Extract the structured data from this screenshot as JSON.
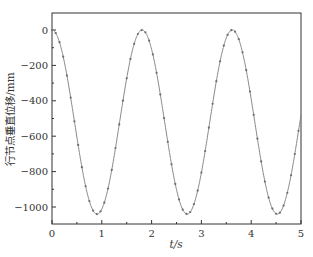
{
  "chart_data": {
    "type": "line",
    "title": "",
    "xlabel": "t/s",
    "ylabel": "行节点垂直位移/mm",
    "xlim": [
      0,
      5
    ],
    "ylim": [
      -1085,
      95
    ],
    "xticks": [
      0,
      1,
      2,
      3,
      4,
      5
    ],
    "xtick_labels": [
      "0",
      "1",
      "2",
      "3",
      "4",
      "5"
    ],
    "yticks": [
      0,
      -200,
      -400,
      -600,
      -800,
      -1000
    ],
    "ytick_labels": [
      "0",
      "−200",
      "−400",
      "−600",
      "−800",
      "−1000"
    ],
    "grid": false,
    "legend": null,
    "series": [
      {
        "name": "vertical displacement",
        "model": "y = -520 + 520*cos(2*pi*t/1.81)",
        "period_s": 1.81,
        "min_value": -1040,
        "max_value": 0,
        "marker": "dot",
        "marker_spacing_s": 0.075,
        "color": "#7a7a7a",
        "key_points": [
          {
            "t": 0.0,
            "y": 0
          },
          {
            "t": 0.45,
            "y": -515
          },
          {
            "t": 0.9,
            "y": -1040
          },
          {
            "t": 1.36,
            "y": -525
          },
          {
            "t": 1.81,
            "y": 0
          },
          {
            "t": 2.26,
            "y": -515
          },
          {
            "t": 2.72,
            "y": -1040
          },
          {
            "t": 3.17,
            "y": -525
          },
          {
            "t": 3.62,
            "y": 0
          },
          {
            "t": 4.07,
            "y": -515
          },
          {
            "t": 4.53,
            "y": -1040
          },
          {
            "t": 5.0,
            "y": -450
          }
        ]
      }
    ]
  },
  "colors": {
    "axis": "#333333",
    "line": "#8a8a8a",
    "marker": "#6e6e6e"
  }
}
